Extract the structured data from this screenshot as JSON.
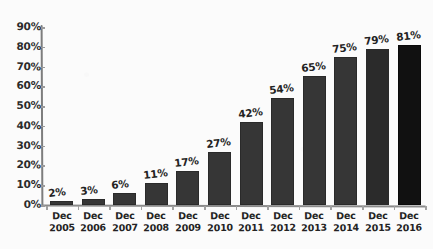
{
  "chart_data": {
    "type": "bar",
    "title": "",
    "subtitle": "",
    "xlabel": "",
    "ylabel": "",
    "categories": [
      "Dec 2005",
      "Dec 2006",
      "Dec 2007",
      "Dec 2008",
      "Dec 2009",
      "Dec 2010",
      "Dec 2011",
      "Dec 2012",
      "Dec 2013",
      "Dec 2014",
      "Dec 2015",
      "Dec 2016"
    ],
    "category_lines": [
      [
        "Dec",
        "2005"
      ],
      [
        "Dec",
        "2006"
      ],
      [
        "Dec",
        "2007"
      ],
      [
        "Dec",
        "2008"
      ],
      [
        "Dec",
        "2009"
      ],
      [
        "Dec",
        "2010"
      ],
      [
        "Dec",
        "2011"
      ],
      [
        "Dec",
        "2012"
      ],
      [
        "Dec",
        "2013"
      ],
      [
        "Dec",
        "2014"
      ],
      [
        "Dec",
        "2015"
      ],
      [
        "Dec",
        "2016"
      ]
    ],
    "values": [
      2,
      3,
      6,
      11,
      17,
      27,
      42,
      54,
      65,
      75,
      79,
      81
    ],
    "data_labels": [
      "2%",
      "3%",
      "6%",
      "11%",
      "17%",
      "27%",
      "42%",
      "54%",
      "65%",
      "75%",
      "79%",
      "81%"
    ],
    "ylim": [
      0,
      90
    ],
    "ytick_values": [
      0,
      10,
      20,
      30,
      40,
      50,
      60,
      70,
      80,
      90
    ],
    "ytick_labels": [
      "0%",
      "10%",
      "20%",
      "30%",
      "40%",
      "50%",
      "60%",
      "70%",
      "80%",
      "90%"
    ],
    "grid": false,
    "legend": false,
    "legend_position": "none",
    "bar_color": "#363636",
    "last_bar_color": "#111111",
    "axis_color": "#8a8a8a",
    "text_color": "#232323",
    "background_color": "#fbfbfb",
    "style": "hand-drawn"
  }
}
